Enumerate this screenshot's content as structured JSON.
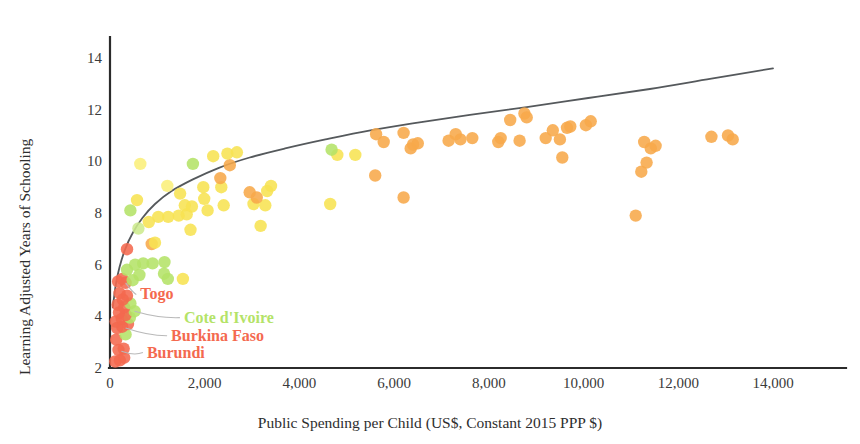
{
  "chart_data": {
    "type": "scatter",
    "title": "",
    "xlabel": "Public Spending per Child (US$, Constant 2015 PPP $)",
    "ylabel": "Learning Adjusted Years of Schooling",
    "xlim": [
      0,
      14600
    ],
    "ylim": [
      2,
      15
    ],
    "grid": false,
    "legend": "none",
    "xticks": [
      0,
      2000,
      4000,
      6000,
      8000,
      10000,
      12000,
      14000
    ],
    "xticklabels": [
      "0",
      "2,000",
      "4,000",
      "6,000",
      "8,000",
      "10,000",
      "12,000",
      "14,000"
    ],
    "yticks": [
      2,
      4,
      6,
      8,
      10,
      12,
      14
    ],
    "yticklabels": [
      "2",
      "4",
      "6",
      "8",
      "10",
      "12",
      "14"
    ],
    "colors": {
      "red": "#f4694f",
      "orange": "#f7a84a",
      "light_orange": "#fbbc63",
      "yellow": "#f7e352",
      "pale_yellow": "#fbef7a",
      "green": "#b4e368",
      "pale_green": "#cdeb8e",
      "trendline": "#55595c",
      "axis": "#2b2b2b",
      "leader": "#b9b9b9"
    },
    "color_meaning": "point colour runs red (lowest) through orange and yellow to green",
    "trendline": {
      "kind": "logarithmic-fit",
      "points": [
        [
          60,
          4.35
        ],
        [
          120,
          5.2
        ],
        [
          200,
          5.9
        ],
        [
          320,
          6.6
        ],
        [
          470,
          7.2
        ],
        [
          680,
          7.8
        ],
        [
          950,
          8.35
        ],
        [
          1300,
          8.85
        ],
        [
          1750,
          9.3
        ],
        [
          2300,
          9.75
        ],
        [
          2950,
          10.15
        ],
        [
          3700,
          10.5
        ],
        [
          4550,
          10.85
        ],
        [
          5500,
          11.2
        ],
        [
          6500,
          11.5
        ],
        [
          7600,
          11.8
        ],
        [
          8800,
          12.1
        ],
        [
          10100,
          12.45
        ],
        [
          11400,
          12.8
        ],
        [
          12700,
          13.2
        ],
        [
          14000,
          13.6
        ]
      ]
    },
    "annotations": [
      {
        "label": "Togo",
        "color": "#f4694f",
        "point": [
          330,
          5.3
        ],
        "text_xy": [
          640,
          4.85
        ]
      },
      {
        "label": "Cote d'Ivoire",
        "color": "#b4e368",
        "point": [
          520,
          4.2
        ],
        "text_xy": [
          1560,
          3.95
        ]
      },
      {
        "label": "Burkina Faso",
        "color": "#f4694f",
        "point": [
          330,
          3.55
        ],
        "text_xy": [
          1290,
          3.25
        ]
      },
      {
        "label": "Burundi",
        "color": "#f4694f",
        "point": [
          240,
          2.65
        ],
        "text_xy": [
          780,
          2.6
        ]
      }
    ],
    "points": [
      {
        "x": 110,
        "y": 2.25,
        "c": "red"
      },
      {
        "x": 210,
        "y": 2.3,
        "c": "red"
      },
      {
        "x": 300,
        "y": 2.4,
        "c": "red"
      },
      {
        "x": 180,
        "y": 2.7,
        "c": "red"
      },
      {
        "x": 290,
        "y": 2.75,
        "c": "red"
      },
      {
        "x": 130,
        "y": 3.1,
        "c": "red"
      },
      {
        "x": 330,
        "y": 3.3,
        "c": "green"
      },
      {
        "x": 150,
        "y": 3.55,
        "c": "red"
      },
      {
        "x": 260,
        "y": 3.6,
        "c": "red"
      },
      {
        "x": 380,
        "y": 3.7,
        "c": "red"
      },
      {
        "x": 120,
        "y": 3.8,
        "c": "red"
      },
      {
        "x": 250,
        "y": 3.9,
        "c": "red"
      },
      {
        "x": 420,
        "y": 3.95,
        "c": "green"
      },
      {
        "x": 330,
        "y": 4.05,
        "c": "red"
      },
      {
        "x": 190,
        "y": 4.15,
        "c": "red"
      },
      {
        "x": 520,
        "y": 4.2,
        "c": "green"
      },
      {
        "x": 300,
        "y": 4.35,
        "c": "red"
      },
      {
        "x": 160,
        "y": 4.45,
        "c": "red"
      },
      {
        "x": 430,
        "y": 4.5,
        "c": "green"
      },
      {
        "x": 270,
        "y": 4.65,
        "c": "red"
      },
      {
        "x": 360,
        "y": 4.8,
        "c": "red"
      },
      {
        "x": 200,
        "y": 4.9,
        "c": "red"
      },
      {
        "x": 330,
        "y": 5.3,
        "c": "red"
      },
      {
        "x": 170,
        "y": 5.35,
        "c": "red"
      },
      {
        "x": 260,
        "y": 5.45,
        "c": "red"
      },
      {
        "x": 480,
        "y": 5.4,
        "c": "green"
      },
      {
        "x": 1220,
        "y": 5.45,
        "c": "green"
      },
      {
        "x": 1540,
        "y": 5.45,
        "c": "yellow"
      },
      {
        "x": 620,
        "y": 5.6,
        "c": "green"
      },
      {
        "x": 1140,
        "y": 5.65,
        "c": "green"
      },
      {
        "x": 360,
        "y": 5.8,
        "c": "green"
      },
      {
        "x": 530,
        "y": 6.0,
        "c": "green"
      },
      {
        "x": 700,
        "y": 6.05,
        "c": "green"
      },
      {
        "x": 900,
        "y": 6.05,
        "c": "green"
      },
      {
        "x": 1150,
        "y": 6.1,
        "c": "green"
      },
      {
        "x": 360,
        "y": 6.6,
        "c": "red"
      },
      {
        "x": 880,
        "y": 6.8,
        "c": "orange"
      },
      {
        "x": 950,
        "y": 6.85,
        "c": "yellow"
      },
      {
        "x": 1700,
        "y": 7.35,
        "c": "yellow"
      },
      {
        "x": 600,
        "y": 7.4,
        "c": "pale_green"
      },
      {
        "x": 820,
        "y": 7.65,
        "c": "yellow"
      },
      {
        "x": 1020,
        "y": 7.85,
        "c": "yellow"
      },
      {
        "x": 1230,
        "y": 7.85,
        "c": "yellow"
      },
      {
        "x": 1450,
        "y": 7.9,
        "c": "yellow"
      },
      {
        "x": 1620,
        "y": 7.95,
        "c": "yellow"
      },
      {
        "x": 2060,
        "y": 8.1,
        "c": "yellow"
      },
      {
        "x": 430,
        "y": 8.1,
        "c": "green"
      },
      {
        "x": 1580,
        "y": 8.3,
        "c": "yellow"
      },
      {
        "x": 1730,
        "y": 8.25,
        "c": "yellow"
      },
      {
        "x": 2400,
        "y": 8.3,
        "c": "yellow"
      },
      {
        "x": 3030,
        "y": 8.35,
        "c": "yellow"
      },
      {
        "x": 3280,
        "y": 8.3,
        "c": "yellow"
      },
      {
        "x": 4650,
        "y": 8.35,
        "c": "yellow"
      },
      {
        "x": 570,
        "y": 8.5,
        "c": "yellow"
      },
      {
        "x": 1990,
        "y": 8.55,
        "c": "yellow"
      },
      {
        "x": 3100,
        "y": 8.6,
        "c": "orange"
      },
      {
        "x": 6200,
        "y": 8.6,
        "c": "orange"
      },
      {
        "x": 1480,
        "y": 8.75,
        "c": "yellow"
      },
      {
        "x": 2950,
        "y": 8.8,
        "c": "orange"
      },
      {
        "x": 3320,
        "y": 8.85,
        "c": "yellow"
      },
      {
        "x": 1970,
        "y": 9.0,
        "c": "yellow"
      },
      {
        "x": 2350,
        "y": 9.0,
        "c": "yellow"
      },
      {
        "x": 3400,
        "y": 9.05,
        "c": "yellow"
      },
      {
        "x": 2330,
        "y": 9.35,
        "c": "orange"
      },
      {
        "x": 5600,
        "y": 9.45,
        "c": "orange"
      },
      {
        "x": 11220,
        "y": 9.6,
        "c": "orange"
      },
      {
        "x": 2530,
        "y": 9.85,
        "c": "orange"
      },
      {
        "x": 1750,
        "y": 9.9,
        "c": "green"
      },
      {
        "x": 11330,
        "y": 9.95,
        "c": "orange"
      },
      {
        "x": 9550,
        "y": 10.15,
        "c": "orange"
      },
      {
        "x": 2180,
        "y": 10.2,
        "c": "yellow"
      },
      {
        "x": 2480,
        "y": 10.3,
        "c": "yellow"
      },
      {
        "x": 4800,
        "y": 10.25,
        "c": "yellow"
      },
      {
        "x": 5180,
        "y": 10.25,
        "c": "yellow"
      },
      {
        "x": 2680,
        "y": 10.35,
        "c": "yellow"
      },
      {
        "x": 4680,
        "y": 10.45,
        "c": "green"
      },
      {
        "x": 6350,
        "y": 10.5,
        "c": "orange"
      },
      {
        "x": 11420,
        "y": 10.5,
        "c": "orange"
      },
      {
        "x": 11520,
        "y": 10.6,
        "c": "orange"
      },
      {
        "x": 6400,
        "y": 10.65,
        "c": "orange"
      },
      {
        "x": 6500,
        "y": 10.7,
        "c": "orange"
      },
      {
        "x": 5780,
        "y": 10.75,
        "c": "orange"
      },
      {
        "x": 7150,
        "y": 10.8,
        "c": "orange"
      },
      {
        "x": 7400,
        "y": 10.85,
        "c": "orange"
      },
      {
        "x": 7650,
        "y": 10.9,
        "c": "orange"
      },
      {
        "x": 8200,
        "y": 10.75,
        "c": "orange"
      },
      {
        "x": 8250,
        "y": 10.9,
        "c": "orange"
      },
      {
        "x": 8650,
        "y": 10.8,
        "c": "orange"
      },
      {
        "x": 9200,
        "y": 10.9,
        "c": "orange"
      },
      {
        "x": 9500,
        "y": 10.85,
        "c": "orange"
      },
      {
        "x": 11280,
        "y": 10.75,
        "c": "orange"
      },
      {
        "x": 12700,
        "y": 10.95,
        "c": "orange"
      },
      {
        "x": 13050,
        "y": 11.0,
        "c": "orange"
      },
      {
        "x": 13150,
        "y": 10.85,
        "c": "orange"
      },
      {
        "x": 5620,
        "y": 11.05,
        "c": "orange"
      },
      {
        "x": 6200,
        "y": 11.1,
        "c": "orange"
      },
      {
        "x": 7300,
        "y": 11.05,
        "c": "orange"
      },
      {
        "x": 9350,
        "y": 11.2,
        "c": "orange"
      },
      {
        "x": 9650,
        "y": 11.3,
        "c": "orange"
      },
      {
        "x": 9720,
        "y": 11.35,
        "c": "orange"
      },
      {
        "x": 10050,
        "y": 11.4,
        "c": "orange"
      },
      {
        "x": 10150,
        "y": 11.55,
        "c": "orange"
      },
      {
        "x": 8450,
        "y": 11.6,
        "c": "orange"
      },
      {
        "x": 8750,
        "y": 11.85,
        "c": "orange"
      },
      {
        "x": 8800,
        "y": 11.7,
        "c": "orange"
      },
      {
        "x": 11100,
        "y": 7.9,
        "c": "orange"
      },
      {
        "x": 640,
        "y": 9.9,
        "c": "pale_yellow"
      },
      {
        "x": 1210,
        "y": 9.05,
        "c": "pale_yellow"
      },
      {
        "x": 3180,
        "y": 7.5,
        "c": "yellow"
      }
    ]
  }
}
